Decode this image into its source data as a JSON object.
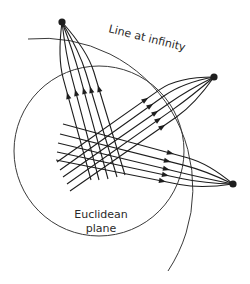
{
  "diagram": {
    "labels": {
      "line_at_infinity": "Line at infinity",
      "euclidean_line1": "Euclidean",
      "euclidean_line2": "plane"
    },
    "colors": {
      "stroke": "#1e1e1e",
      "circle": "#3a3a3a",
      "background": "#ffffff"
    },
    "euclidean_plane": {
      "cx": 99,
      "cy": 151,
      "r": 85
    },
    "line_at_infinity": {
      "start": [
        28,
        39
      ],
      "end": [
        168,
        271
      ],
      "r": 150
    },
    "points_at_infinity": [
      {
        "name": "top-left",
        "x": 62,
        "y": 22
      },
      {
        "name": "upper-right",
        "x": 214,
        "y": 77
      },
      {
        "name": "lower-right",
        "x": 233,
        "y": 184
      }
    ],
    "families": [
      {
        "name": "steep-family",
        "target": 0,
        "lines": [
          {
            "start": [
              91,
              180
            ],
            "arrow": [
              68,
              96
            ]
          },
          {
            "start": [
              99,
              180
            ],
            "arrow": [
              76,
              93
            ]
          },
          {
            "start": [
              108,
              179
            ],
            "arrow": [
              84,
              91
            ]
          },
          {
            "start": [
              117,
              177
            ],
            "arrow": [
              91,
              90
            ]
          },
          {
            "start": [
              125,
              175
            ],
            "arrow": [
              99,
              89
            ]
          }
        ]
      },
      {
        "name": "rising-family",
        "target": 1,
        "lines": [
          {
            "start": [
              57,
              162
            ],
            "arrow": [
              145,
              100
            ]
          },
          {
            "start": [
              60,
              170
            ],
            "arrow": [
              150,
              106
            ]
          },
          {
            "start": [
              63,
              177
            ],
            "arrow": [
              155,
              113
            ]
          },
          {
            "start": [
              67,
              184
            ],
            "arrow": [
              158,
              120
            ]
          },
          {
            "start": [
              70,
              191
            ],
            "arrow": [
              162,
              127
            ]
          }
        ]
      },
      {
        "name": "flat-family",
        "target": 2,
        "lines": [
          {
            "start": [
              63,
              124
            ],
            "arrow": [
              170,
              153
            ]
          },
          {
            "start": [
              60,
              134
            ],
            "arrow": [
              167,
              161
            ]
          },
          {
            "start": [
              58,
              143
            ],
            "arrow": [
              166,
              169
            ]
          },
          {
            "start": [
              57,
              152
            ],
            "arrow": [
              165,
              175
            ]
          },
          {
            "start": [
              56,
              160
            ],
            "arrow": [
              162,
              181
            ]
          }
        ]
      }
    ]
  }
}
